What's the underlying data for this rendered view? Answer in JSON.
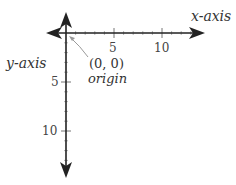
{
  "diagram": {
    "type": "coordinate-axes",
    "x_axis_label": "x-axis",
    "y_axis_label": "y-axis",
    "origin_coords": "(0, 0)",
    "origin_label": "origin",
    "x_ticks": [
      {
        "value": 5,
        "label": "5"
      },
      {
        "value": 10,
        "label": "10"
      }
    ],
    "y_ticks": [
      {
        "value": 5,
        "label": "5"
      },
      {
        "value": 10,
        "label": "10"
      }
    ],
    "minor_tick_step": 1,
    "x_minor_range": [
      1,
      14
    ],
    "y_minor_range": [
      1,
      14
    ],
    "y_axis_direction": "down-positive",
    "colors": {
      "axis": "#222222",
      "minor_tick": "#aaaaaa",
      "pointer": "#999999",
      "text": "#333333"
    }
  }
}
